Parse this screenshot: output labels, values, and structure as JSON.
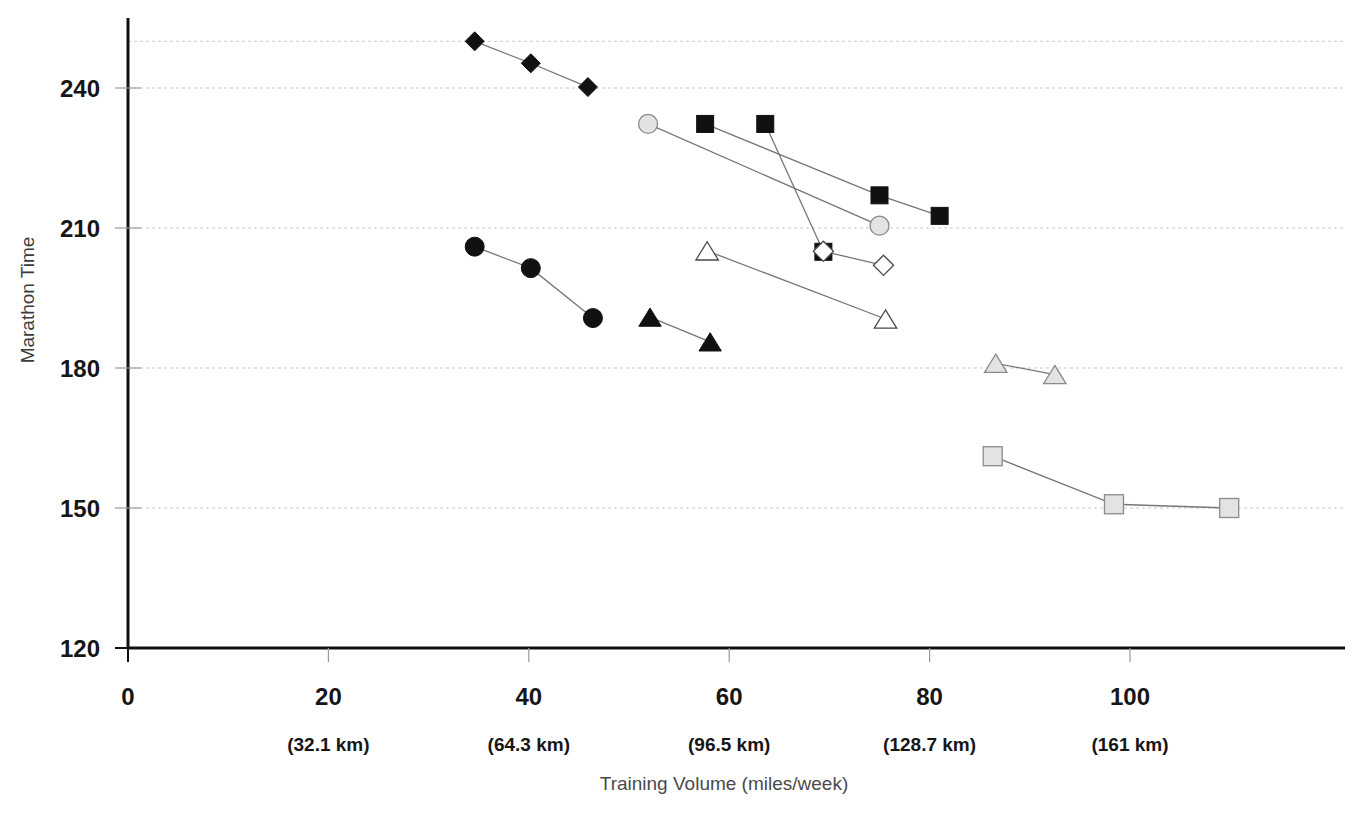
{
  "chart_data": {
    "type": "scatter",
    "title": "",
    "xlabel": "Training Volume (miles/week)",
    "ylabel": "Marathon Time",
    "xlim": [
      0,
      100
    ],
    "ylim": [
      120,
      252
    ],
    "grid": true,
    "legend": "none",
    "x_ticks": [
      {
        "value": 0,
        "label": "0",
        "sublabel": ""
      },
      {
        "value": 20,
        "label": "20",
        "sublabel": "(32.1 km)"
      },
      {
        "value": 40,
        "label": "40",
        "sublabel": "(64.3 km)"
      },
      {
        "value": 60,
        "label": "60",
        "sublabel": "(96.5 km)"
      },
      {
        "value": 80,
        "label": "80",
        "sublabel": "(128.7 km)"
      },
      {
        "value": 100,
        "label": "100",
        "sublabel": "(161 km)"
      }
    ],
    "y_ticks": [
      {
        "value": 120,
        "label": "120"
      },
      {
        "value": 150,
        "label": "150"
      },
      {
        "value": 180,
        "label": "180"
      },
      {
        "value": 210,
        "label": "210"
      },
      {
        "value": 240,
        "label": "240"
      }
    ],
    "gridlines_y": [
      150,
      180,
      210,
      240,
      250
    ],
    "series": [
      {
        "name": "black-diamond-series",
        "marker": "diamond",
        "fill": "#111111",
        "stroke": "#111111",
        "size": 17,
        "points": [
          {
            "x": 34.6,
            "y": 250.0
          },
          {
            "x": 40.2,
            "y": 245.3
          },
          {
            "x": 45.9,
            "y": 240.2
          }
        ]
      },
      {
        "name": "black-square-series-a",
        "marker": "square",
        "fill": "#111111",
        "stroke": "#111111",
        "size": 17,
        "points": [
          {
            "x": 57.6,
            "y": 232.3
          },
          {
            "x": 75.0,
            "y": 217.0
          },
          {
            "x": 81.0,
            "y": 212.6
          }
        ]
      },
      {
        "name": "black-square-series-b",
        "marker": "square",
        "fill": "#111111",
        "stroke": "#111111",
        "size": 17,
        "points": [
          {
            "x": 63.6,
            "y": 232.3
          },
          {
            "x": 69.4,
            "y": 204.9
          }
        ]
      },
      {
        "name": "gray-circle-series",
        "marker": "circle",
        "fill": "#e3e3e3",
        "stroke": "#8a8a8a",
        "size": 19,
        "points": [
          {
            "x": 51.9,
            "y": 232.3
          },
          {
            "x": 75.0,
            "y": 210.5
          }
        ]
      },
      {
        "name": "white-diamond-series",
        "marker": "diamond",
        "fill": "#ffffff",
        "stroke": "#4a4a4a",
        "size": 18,
        "points": [
          {
            "x": 69.4,
            "y": 205.0
          },
          {
            "x": 75.4,
            "y": 202.0
          }
        ]
      },
      {
        "name": "black-circle-series",
        "marker": "circle",
        "fill": "#111111",
        "stroke": "#111111",
        "size": 19,
        "points": [
          {
            "x": 34.6,
            "y": 206.0
          },
          {
            "x": 40.2,
            "y": 201.4
          },
          {
            "x": 46.4,
            "y": 190.7
          }
        ]
      },
      {
        "name": "black-triangle-series",
        "marker": "triangle",
        "fill": "#111111",
        "stroke": "#111111",
        "size": 19,
        "points": [
          {
            "x": 52.1,
            "y": 190.9
          },
          {
            "x": 58.1,
            "y": 185.6
          }
        ]
      },
      {
        "name": "white-triangle-series",
        "marker": "triangle",
        "fill": "#ffffff",
        "stroke": "#4a4a4a",
        "size": 19,
        "points": [
          {
            "x": 57.8,
            "y": 205.1
          },
          {
            "x": 75.6,
            "y": 190.5
          }
        ]
      },
      {
        "name": "gray-triangle-series",
        "marker": "triangle",
        "fill": "#e3e3e3",
        "stroke": "#8a8a8a",
        "size": 19,
        "points": [
          {
            "x": 86.6,
            "y": 181.0
          },
          {
            "x": 92.5,
            "y": 178.6
          }
        ]
      },
      {
        "name": "gray-square-series",
        "marker": "square",
        "fill": "#e3e3e3",
        "stroke": "#8a8a8a",
        "size": 19,
        "points": [
          {
            "x": 86.3,
            "y": 161.1
          },
          {
            "x": 98.4,
            "y": 150.8
          },
          {
            "x": 109.9,
            "y": 150.0
          }
        ]
      }
    ]
  },
  "axis": {
    "y_title": "Marathon Time",
    "x_title": "Training Volume (miles/week)"
  }
}
